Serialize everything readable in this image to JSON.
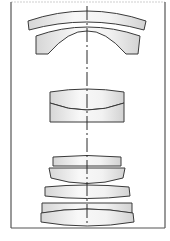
{
  "diagram": {
    "type": "optical lens cross-section",
    "colors": {
      "stroke": "#3a3a3a",
      "glass_light": "#f7f7f7",
      "glass_dark": "#d9d9d9",
      "frame": "#555555"
    },
    "optical_axis": {
      "x": 87,
      "y1": 6,
      "y2": 226,
      "style": "dash-dot"
    },
    "frame": {
      "left": 11,
      "right": 165,
      "top": 2,
      "bottom": 228
    },
    "elements": [
      {
        "id": "L1",
        "shape": "meniscus",
        "group": "front"
      },
      {
        "id": "L2",
        "shape": "concave meniscus",
        "group": "front"
      },
      {
        "id": "L3",
        "shape": "cemented doublet",
        "group": "middle"
      },
      {
        "id": "L4",
        "shape": "plano lens",
        "group": "rear"
      },
      {
        "id": "L5",
        "shape": "plano-convex",
        "group": "rear"
      },
      {
        "id": "L6",
        "shape": "biconvex",
        "group": "rear"
      },
      {
        "id": "L7",
        "shape": "plano",
        "group": "rear"
      },
      {
        "id": "L8",
        "shape": "convex",
        "group": "rear"
      }
    ]
  }
}
